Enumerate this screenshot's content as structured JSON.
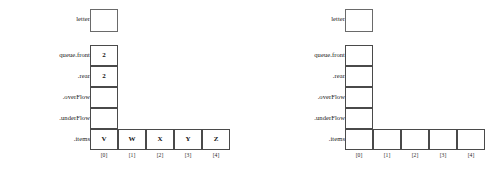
{
  "figure": {
    "panels": [
      {
        "id": "left",
        "letter_label": "letter",
        "letter_value": "",
        "fields": [
          {
            "label": "queue.front",
            "value": "2"
          },
          {
            "label": ".rear",
            "value": "2"
          },
          {
            "label": ".overFlow",
            "value": ""
          },
          {
            "label": ".underFlow",
            "value": ""
          }
        ],
        "items_label": ".items",
        "items": [
          "V",
          "W",
          "X",
          "Y",
          "Z"
        ],
        "index_labels": [
          "[0]",
          "[1]",
          "[2]",
          "[3]",
          "[4]"
        ]
      },
      {
        "id": "right",
        "letter_label": "letter",
        "letter_value": "",
        "fields": [
          {
            "label": "queue.front",
            "value": ""
          },
          {
            "label": ".rear",
            "value": ""
          },
          {
            "label": ".overFlow",
            "value": ""
          },
          {
            "label": ".underFlow",
            "value": ""
          }
        ],
        "items_label": ".items",
        "items": [
          "",
          "",
          "",
          "",
          ""
        ],
        "index_labels": [
          "[0]",
          "[1]",
          "[2]",
          "[3]",
          "[4]"
        ]
      }
    ],
    "colors": {
      "background": "#ffffff",
      "border": "#4a4a4a",
      "text": "#1a1a1a"
    }
  }
}
